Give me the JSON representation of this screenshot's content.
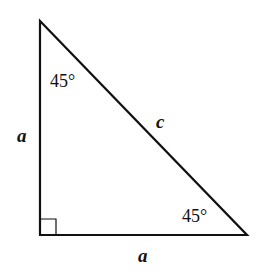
{
  "diagram": {
    "type": "right-isosceles-triangle",
    "angles": {
      "top": "45°",
      "bottom_right": "45°"
    },
    "sides": {
      "hypotenuse": "c",
      "left_leg": "a",
      "bottom_leg": "a"
    },
    "right_angle_marker": "bottom-left",
    "colors": {
      "stroke": "#111111",
      "background": "#ffffff"
    }
  }
}
